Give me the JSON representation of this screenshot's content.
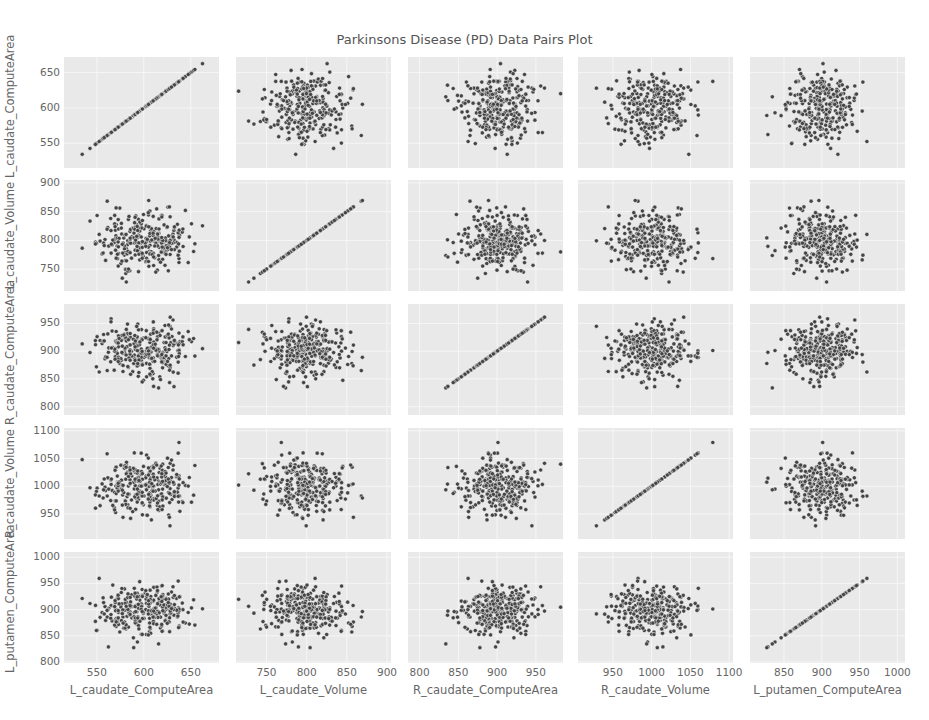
{
  "chart_data": {
    "type": "scatter",
    "title": "Parkinsons Disease (PD) Data Pairs Plot",
    "layout": "pairs-matrix-5x5",
    "grid": true,
    "legend": null,
    "marker_color": "#444444",
    "background_color": "#e9e9e9",
    "variables": [
      {
        "name": "L_caudate_ComputeArea",
        "range": [
          515,
          680
        ],
        "yrange": [
          515,
          672
        ],
        "xticks": [
          550,
          600,
          650
        ],
        "yticks": [
          550,
          600,
          650
        ],
        "mean": 600,
        "sd": 25
      },
      {
        "name": "L_caudate_Volume",
        "range": [
          712,
          905
        ],
        "yrange": [
          712,
          905
        ],
        "xticks": [
          750,
          800,
          850,
          900
        ],
        "yticks": [
          750,
          800,
          850,
          900
        ],
        "mean": 800,
        "sd": 25
      },
      {
        "name": "R_caudate_ComputeArea",
        "range": [
          785,
          985
        ],
        "yrange": [
          785,
          985
        ],
        "xticks": [
          800,
          850,
          900,
          950
        ],
        "yticks": [
          800,
          850,
          900,
          950
        ],
        "mean": 900,
        "sd": 25
      },
      {
        "name": "R_caudate_Volume",
        "range": [
          905,
          1105
        ],
        "yrange": [
          905,
          1105
        ],
        "xticks": [
          950,
          1000,
          1050,
          1100
        ],
        "yticks": [
          950,
          1000,
          1050,
          1100
        ],
        "mean": 1000,
        "sd": 25
      },
      {
        "name": "L_putamen_ComputeArea",
        "range": [
          805,
          1010
        ],
        "yrange": [
          798,
          1010
        ],
        "xticks": [
          850,
          900,
          950,
          1000
        ],
        "yticks": [
          800,
          850,
          900,
          950,
          1000
        ],
        "mean": 900,
        "sd": 25
      }
    ],
    "n_points_per_panel": 300,
    "diagonal": "identity scatter (variable vs itself)",
    "off_diagonal": "uncorrelated scatter clouds centered on each variable's mean"
  }
}
